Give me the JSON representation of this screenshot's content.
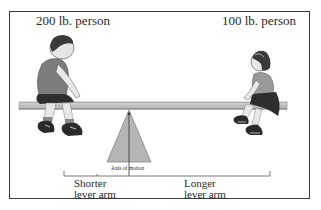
{
  "diagram": {
    "left_person": {
      "label": "200 lb. person",
      "figure": "boy"
    },
    "right_person": {
      "label": "100 lb. person",
      "figure": "girl"
    },
    "fulcrum": {
      "label": "Axis of motion"
    },
    "left_arm": {
      "label_line1": "Shorter",
      "label_line2": "lever arm"
    },
    "right_arm": {
      "label_line1": "Longer",
      "label_line2": "lever arm"
    }
  },
  "colors": {
    "frame": "#3a3a3a",
    "board": "#a9a9a9",
    "fulcrum": "#b5b5b5",
    "text": "#2a2a2a"
  }
}
